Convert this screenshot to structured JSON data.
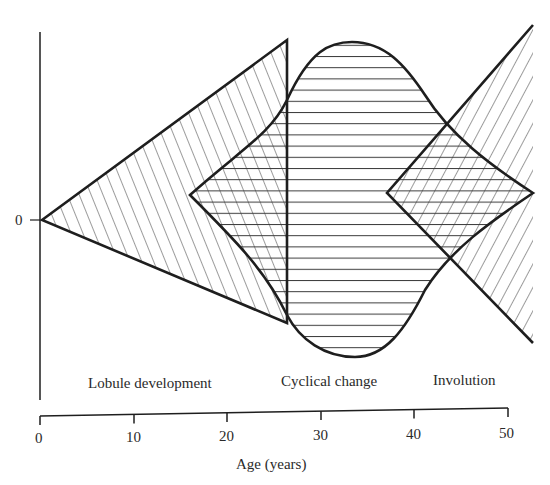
{
  "diagram": {
    "type": "phase-hatched-shapes",
    "y_axis": {
      "zero_label": "0"
    },
    "x_axis": {
      "title": "Age (years)",
      "ticks": [
        "0",
        "10",
        "20",
        "30",
        "40",
        "50"
      ],
      "range": [
        0,
        50
      ]
    },
    "phases": [
      {
        "name": "Lobule development",
        "age_start": 0,
        "age_end": 25,
        "shape": "triangle widening",
        "hatch": "diagonal-back"
      },
      {
        "name": "Cyclical change",
        "age_start": 15,
        "age_end": 50,
        "shape": "bell / lens",
        "hatch": "horizontal"
      },
      {
        "name": "Involution",
        "age_start": 35,
        "age_end": 50,
        "shape": "triangle widening",
        "hatch": "diagonal-forward"
      }
    ],
    "labels": {
      "phase1": "Lobule development",
      "phase2": "Cyclical change",
      "phase3": "Involution"
    },
    "colors": {
      "line": "#1e1e1e",
      "hatch": "#3a3a3a",
      "background": "#ffffff"
    }
  }
}
